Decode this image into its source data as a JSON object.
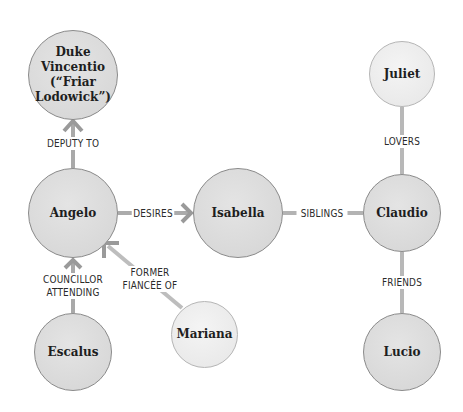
{
  "diagram": {
    "type": "character-relationship-map",
    "nodes": [
      {
        "id": "duke",
        "label": "Duke Vincentio (“Friar Lodowick”)",
        "lines": [
          "Duke",
          "Vincentio",
          "(“Friar",
          "Lodowick”)"
        ],
        "shade": "dark"
      },
      {
        "id": "angelo",
        "label": "Angelo",
        "shade": "dark"
      },
      {
        "id": "isabella",
        "label": "Isabella",
        "shade": "dark"
      },
      {
        "id": "claudio",
        "label": "Claudio",
        "shade": "dark"
      },
      {
        "id": "juliet",
        "label": "Juliet",
        "shade": "light"
      },
      {
        "id": "escalus",
        "label": "Escalus",
        "shade": "dark"
      },
      {
        "id": "mariana",
        "label": "Mariana",
        "shade": "light"
      },
      {
        "id": "lucio",
        "label": "Lucio",
        "shade": "dark"
      }
    ],
    "edges": [
      {
        "from": "angelo",
        "to": "duke",
        "label": "DEPUTY TO",
        "directed": true
      },
      {
        "from": "angelo",
        "to": "isabella",
        "label": "DESIRES",
        "directed": true
      },
      {
        "from": "isabella",
        "to": "claudio",
        "label": "SIBLINGS",
        "directed": false
      },
      {
        "from": "juliet",
        "to": "claudio",
        "label": "LOVERS",
        "directed": false
      },
      {
        "from": "claudio",
        "to": "lucio",
        "label": "FRIENDS",
        "directed": false
      },
      {
        "from": "escalus",
        "to": "angelo",
        "label": "COUNCILLOR ATTENDING",
        "lines": [
          "COUNCILLOR",
          "ATTENDING"
        ],
        "directed": true
      },
      {
        "from": "mariana",
        "to": "angelo",
        "label": "FORMER FIANCÉE OF",
        "lines": [
          "FORMER",
          "FIANCÉE OF"
        ],
        "directed": true
      }
    ]
  },
  "colors": {
    "node_fill_dark": "#dadada",
    "node_fill_light": "#ececec",
    "node_border": "#8a8a8a",
    "edge": "#b0b0b0",
    "text": "#1e1e1e"
  }
}
